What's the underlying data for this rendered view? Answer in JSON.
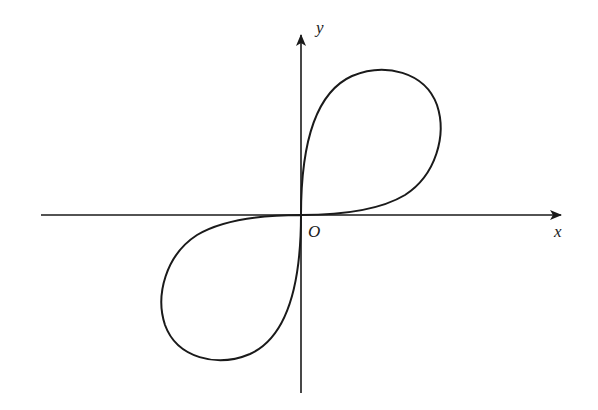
{
  "diagram": {
    "type": "curve-plot",
    "axes": {
      "x_label": "x",
      "y_label": "y",
      "origin_label": "O"
    },
    "colors": {
      "stroke": "#1a1a1a",
      "background": "#ffffff"
    }
  }
}
